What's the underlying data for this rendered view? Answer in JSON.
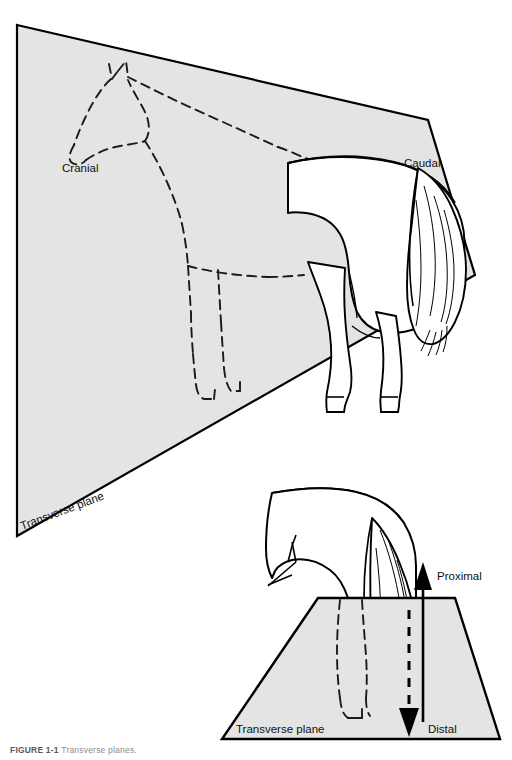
{
  "figure": {
    "background_color": "#ffffff",
    "plane_fill": "#e4e4e4",
    "plane_stroke": "#000000",
    "body_fill": "#ffffff",
    "line_color": "#000000"
  },
  "upper_panel": {
    "name": "transverse-plane-through-trunk",
    "plane_label": "Transverse plane",
    "cranial_label": "Cranial",
    "caudal_label": "Caudal",
    "horse_cranial_part": "dashed outline of head, neck, chest and forelimbs (cranial to the plane)",
    "horse_caudal_part": "solid outline of hindquarters, tail and hindlimbs (caudal to the plane)"
  },
  "lower_panel": {
    "name": "transverse-plane-through-limb",
    "plane_label": "Transverse plane",
    "proximal_label": "Proximal",
    "distal_label": "Distal",
    "proximal_arrow": "solid upward arrow",
    "distal_arrow": "dashed downward arrow",
    "limb_below_plane": "dashed outline of distal limb"
  },
  "caption": {
    "number": "FIGURE 1-1",
    "text": "Transverse planes."
  }
}
